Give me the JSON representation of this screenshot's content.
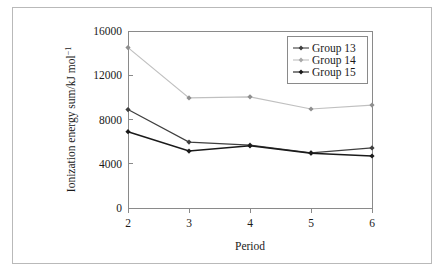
{
  "chart_data": {
    "type": "line",
    "title": "",
    "xlabel": "Period",
    "ylabel": "Ionization energy sum/kJ mol",
    "ylabel_superscript": "−1",
    "x": [
      2,
      3,
      4,
      5,
      6
    ],
    "xticklabels": [
      "2",
      "3",
      "4",
      "5",
      "6"
    ],
    "yticklabels": [
      "0",
      "4000",
      "8000",
      "12000",
      "16000"
    ],
    "yticks": [
      0,
      4000,
      8000,
      12000,
      16000
    ],
    "xlim": [
      2,
      6
    ],
    "ylim": [
      0,
      16000
    ],
    "grid": false,
    "legend_position": "top-right",
    "series": [
      {
        "name": "Group 13",
        "values": [
          8900,
          5960,
          5680,
          4990,
          5430
        ],
        "color": "#3f3f3f",
        "marker": "diamond"
      },
      {
        "name": "Group 14",
        "values": [
          14500,
          9950,
          10050,
          8950,
          9300
        ],
        "color": "#c0c0c0",
        "marker": "diamond"
      },
      {
        "name": "Group 15",
        "values": [
          6900,
          5150,
          5620,
          4960,
          4700
        ],
        "color": "#1a1a1a",
        "marker": "diamond"
      }
    ]
  },
  "legend": {
    "items": [
      {
        "label": "Group 13"
      },
      {
        "label": "Group 14"
      },
      {
        "label": "Group 15"
      }
    ]
  },
  "axes": {
    "x_title": "Period",
    "y_title_main": "Ionization energy sum/kJ mol",
    "y_title_sup": "−1"
  }
}
